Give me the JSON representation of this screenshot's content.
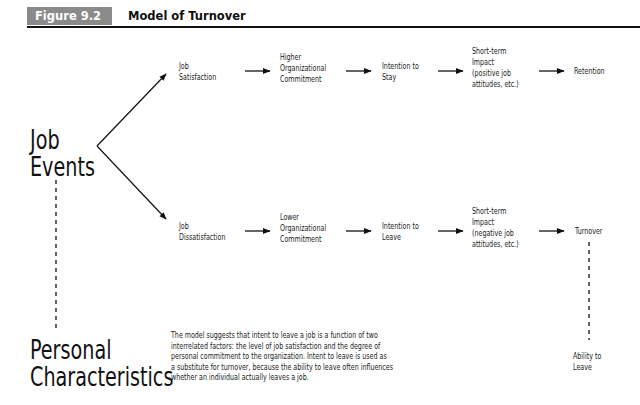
{
  "header": {
    "figure_label": "Figure 9.2",
    "title": "Model of Turnover",
    "label_bg_color": "#8a8a8a"
  },
  "root": {
    "job_events": [
      "Job",
      "Events"
    ],
    "personal_characteristics": [
      "Personal",
      "Characteristics"
    ]
  },
  "upper_path": {
    "nodes": [
      {
        "lines": [
          "Job",
          "Satisfaction"
        ]
      },
      {
        "lines": [
          "Higher",
          "Organizational",
          "Commitment"
        ]
      },
      {
        "lines": [
          "Intention to",
          "Stay"
        ]
      },
      {
        "lines": [
          "Short-term",
          "Impact",
          "(positive job",
          "attitudes, etc.)"
        ]
      },
      {
        "lines": [
          "Retention"
        ]
      }
    ]
  },
  "lower_path": {
    "nodes": [
      {
        "lines": [
          "Job",
          "Dissatisfaction"
        ]
      },
      {
        "lines": [
          "Lower",
          "Organizational",
          "Commitment"
        ]
      },
      {
        "lines": [
          "Intention to",
          "Leave"
        ]
      },
      {
        "lines": [
          "Short-term",
          "Impact",
          "(negative job",
          "attitudes, etc.)"
        ]
      },
      {
        "lines": [
          "Turnover"
        ]
      }
    ]
  },
  "moderator": {
    "lines": [
      "Ability to",
      "Leave"
    ]
  },
  "note": {
    "lines": [
      "The model suggests that intent to leave a job is a function of two",
      "interrelated factors: the level of job satisfaction and the degree of",
      "personal commitment to the organization. Intent to leave is used as",
      "a substitute for turnover, because the ability to leave often influences",
      "whether an individual actually leaves a job."
    ]
  }
}
